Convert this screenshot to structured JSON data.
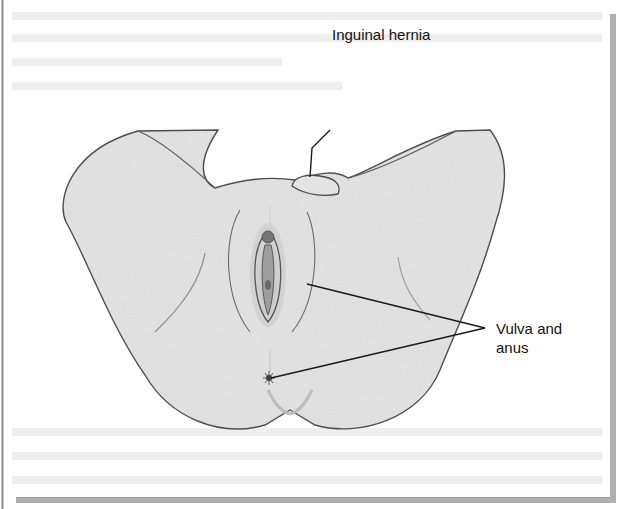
{
  "figure": {
    "labels": {
      "inguinal_hernia": "Inguinal hernia",
      "vulva_line1": "Vulva and",
      "vulva_line2": "anus"
    },
    "colors": {
      "skin": "#e3e3e3",
      "outline": "#555555",
      "leader": "#222222",
      "frame_shadow": "#a8a8a8",
      "ghost_text": "#ececec"
    }
  }
}
